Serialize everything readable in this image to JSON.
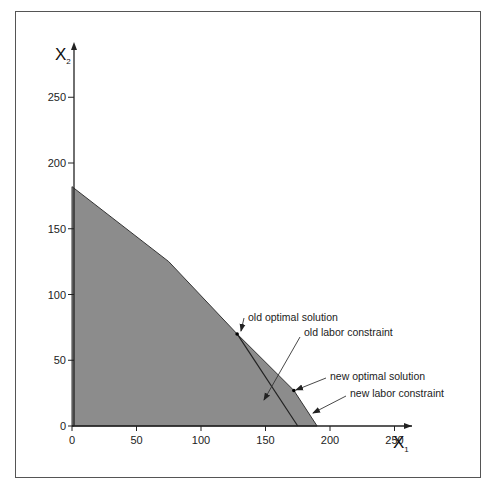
{
  "chart_data": {
    "type": "area",
    "title": "",
    "xlabel": "X",
    "xlabel_subscript": "1",
    "ylabel": "X",
    "ylabel_subscript": "2",
    "xlim": [
      0,
      280
    ],
    "ylim": [
      0,
      280
    ],
    "grid": false,
    "x_ticks": [
      0,
      50,
      100,
      150,
      200,
      250
    ],
    "y_ticks": [
      0,
      50,
      100,
      150,
      200,
      250
    ],
    "feasible_region": {
      "name": "feasible region (new)",
      "fill": "#8c8c8c",
      "vertices": [
        [
          0,
          0
        ],
        [
          0,
          182
        ],
        [
          75,
          125
        ],
        [
          128,
          70
        ],
        [
          172,
          27
        ],
        [
          190,
          0
        ]
      ]
    },
    "lines": [
      {
        "name": "old labor constraint",
        "points": [
          [
            128,
            70
          ],
          [
            175,
            0
          ]
        ]
      }
    ],
    "points": [
      {
        "name": "old optimal solution",
        "x": 128,
        "y": 70
      },
      {
        "name": "new optimal solution",
        "x": 172,
        "y": 27
      }
    ],
    "annotations": [
      {
        "text": "old optimal solution",
        "text_px": [
          246,
          321
        ],
        "arrow_from": [
          244,
          318
        ],
        "arrow_to": [
          241,
          331
        ]
      },
      {
        "text": "old labor constraint",
        "text_px": [
          302,
          336
        ],
        "arrow_from": [
          300,
          337
        ],
        "arrow_to": [
          264,
          400
        ]
      },
      {
        "text": "new optimal solution",
        "text_px": [
          328,
          380
        ],
        "arrow_from": [
          326,
          378
        ],
        "arrow_to": [
          296,
          390
        ]
      },
      {
        "text": "new labor constraint",
        "text_px": [
          348,
          397
        ],
        "arrow_from": [
          346,
          396
        ],
        "arrow_to": [
          313,
          413
        ]
      }
    ]
  },
  "axes": {
    "x_title": "X",
    "x_sub": "1",
    "y_title": "X",
    "y_sub": "2",
    "x_tick_labels": [
      "0",
      "50",
      "100",
      "150",
      "200",
      "250"
    ],
    "y_tick_labels": [
      "0",
      "50",
      "100",
      "150",
      "200",
      "250"
    ]
  },
  "labels": {
    "old_optimal": "old optimal solution",
    "old_labor": "old labor constraint",
    "new_optimal": "new optimal solution",
    "new_labor": "new labor constraint"
  },
  "colors": {
    "fill": "#8c8c8c",
    "line": "#222222",
    "frame": "#555555"
  }
}
